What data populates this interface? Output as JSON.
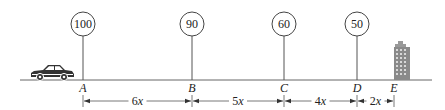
{
  "diagram": {
    "signs": [
      {
        "point": "A",
        "speed": "100",
        "x": 83
      },
      {
        "point": "B",
        "speed": "90",
        "x": 192
      },
      {
        "point": "C",
        "speed": "60",
        "x": 284
      },
      {
        "point": "D",
        "speed": "50",
        "x": 357
      }
    ],
    "points": [
      {
        "label": "A",
        "x": 83
      },
      {
        "label": "B",
        "x": 192
      },
      {
        "label": "C",
        "x": 284
      },
      {
        "label": "D",
        "x": 357
      },
      {
        "label": "E",
        "x": 394
      }
    ],
    "segments": [
      {
        "from": "A",
        "to": "B",
        "label": "6x",
        "x1": 83,
        "x2": 192
      },
      {
        "from": "B",
        "to": "C",
        "label": "5x",
        "x1": 192,
        "x2": 284
      },
      {
        "from": "C",
        "to": "D",
        "label": "4x",
        "x1": 284,
        "x2": 357
      },
      {
        "from": "D",
        "to": "E",
        "label": "2x",
        "x1": 357,
        "x2": 394
      }
    ],
    "icons": {
      "vehicle": "car-icon",
      "destination": "building-icon"
    },
    "colors": {
      "line": "#555555",
      "text": "#222222",
      "car": "#333333",
      "building": "#888888"
    }
  }
}
